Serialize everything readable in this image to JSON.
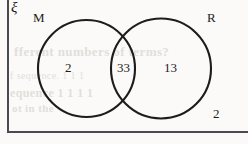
{
  "figure": {
    "kind": "venn-diagram-two-set",
    "universal_set_symbol": "ξ",
    "sets": [
      {
        "id": "M",
        "label": "M"
      },
      {
        "id": "R",
        "label": "R"
      }
    ],
    "regions": [
      {
        "id": "M-only",
        "label": "M only",
        "value": "2"
      },
      {
        "id": "both",
        "label": "M and R",
        "value": "33"
      },
      {
        "id": "R-only",
        "label": "R only",
        "value": "13"
      },
      {
        "id": "neither",
        "label": "neither M nor R",
        "value": "2"
      }
    ],
    "colors": {
      "outline": "#1c1c1c",
      "rectangle": "#4a4a52",
      "text": "#1c1c1c",
      "background": "#fbfaf8"
    }
  },
  "bleed_through": {
    "line1": "fferent numbers of terms?",
    "line2": "f sequence.  1 1 1",
    "line3": "equence  1 1 1 1",
    "line4": "ot in the"
  }
}
